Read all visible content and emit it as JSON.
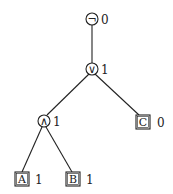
{
  "diagram": {
    "type": "logic-expression-tree",
    "nodes": [
      {
        "id": "not",
        "kind": "operator",
        "symbol": "¬",
        "value": "0"
      },
      {
        "id": "or",
        "kind": "operator",
        "symbol": "∨",
        "value": "1"
      },
      {
        "id": "and",
        "kind": "operator",
        "symbol": "∧",
        "value": "1"
      },
      {
        "id": "C",
        "kind": "variable",
        "symbol": "C",
        "value": "0"
      },
      {
        "id": "A",
        "kind": "variable",
        "symbol": "A",
        "value": "1"
      },
      {
        "id": "B",
        "kind": "variable",
        "symbol": "B",
        "value": "1"
      }
    ],
    "edges": [
      {
        "from": "not",
        "to": "or"
      },
      {
        "from": "or",
        "to": "and"
      },
      {
        "from": "or",
        "to": "C"
      },
      {
        "from": "and",
        "to": "A"
      },
      {
        "from": "and",
        "to": "B"
      }
    ]
  }
}
